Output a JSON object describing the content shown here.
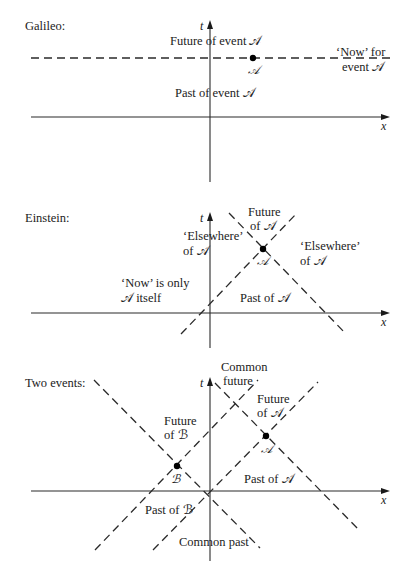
{
  "panels": [
    {
      "title": "Galileo:",
      "title_pos": [
        25,
        30
      ],
      "axes": {
        "x_axis": {
          "x1": 31,
          "x2": 390,
          "y": 117,
          "label": "x",
          "label_pos": [
            381,
            130
          ]
        },
        "t_axis": {
          "x": 210,
          "y1": 182,
          "y2": 20,
          "label": "t",
          "label_pos": [
            200,
            30
          ]
        }
      },
      "dashed_lines": [
        {
          "x1": 31,
          "y1": 58,
          "x2": 390,
          "y2": 58
        }
      ],
      "points": [
        {
          "name": "A",
          "cx": 253,
          "cy": 58,
          "label": "𝒜",
          "label_pos": [
            248,
            74
          ]
        }
      ],
      "labels": [
        {
          "text": "Future of event 𝒜",
          "x": 170,
          "y": 45
        },
        {
          "text": "‘Now’ for",
          "x": 336,
          "y": 56
        },
        {
          "text": "event 𝒜",
          "x": 342,
          "y": 71
        },
        {
          "text": "Past of event 𝒜",
          "x": 175,
          "y": 97
        }
      ]
    },
    {
      "title": "Einstein:",
      "title_pos": [
        25,
        222
      ],
      "axes": {
        "x_axis": {
          "x1": 31,
          "x2": 390,
          "y": 313,
          "label": "x",
          "label_pos": [
            381,
            326
          ]
        },
        "t_axis": {
          "x": 210,
          "y1": 348,
          "y2": 212,
          "label": "t",
          "label_pos": [
            200,
            222
          ]
        }
      },
      "dashed_lines": [
        {
          "x1": 181,
          "y1": 334,
          "x2": 297,
          "y2": 213
        },
        {
          "x1": 229,
          "y1": 213,
          "x2": 346,
          "y2": 334
        }
      ],
      "points": [
        {
          "name": "A",
          "cx": 263,
          "cy": 249,
          "label": "𝒜",
          "label_pos": [
            257,
            265
          ]
        }
      ],
      "labels": [
        {
          "text": "Future",
          "x": 248,
          "y": 216
        },
        {
          "text": "of 𝒜",
          "x": 250,
          "y": 230
        },
        {
          "text": "‘Elsewhere’",
          "x": 183,
          "y": 240
        },
        {
          "text": "of  𝒜",
          "x": 183,
          "y": 255
        },
        {
          "text": "‘Elsewhere’",
          "x": 300,
          "y": 250
        },
        {
          "text": "of 𝒜",
          "x": 300,
          "y": 265
        },
        {
          "text": "‘Now’ is only",
          "x": 121,
          "y": 287
        },
        {
          "text": "𝒜 itself",
          "x": 121,
          "y": 302
        },
        {
          "text": "Past of 𝒜",
          "x": 240,
          "y": 302
        }
      ]
    },
    {
      "title": "Two events:",
      "title_pos": [
        25,
        387
      ],
      "axes": {
        "x_axis": {
          "x1": 31,
          "x2": 390,
          "y": 491,
          "label": "x",
          "label_pos": [
            381,
            504
          ]
        },
        "t_axis": {
          "x": 210,
          "y1": 561,
          "y2": 377,
          "label": "t",
          "label_pos": [
            200,
            387
          ]
        }
      },
      "dashed_lines": [
        {
          "x1": 94,
          "y1": 380,
          "x2": 260,
          "y2": 548
        },
        {
          "x1": 95,
          "y1": 550,
          "x2": 258,
          "y2": 380
        },
        {
          "x1": 215,
          "y1": 383,
          "x2": 360,
          "y2": 531
        },
        {
          "x1": 153,
          "y1": 550,
          "x2": 318,
          "y2": 382
        }
      ],
      "points": [
        {
          "name": "A",
          "cx": 266,
          "cy": 436,
          "label": "𝒜",
          "label_pos": [
            261,
            453
          ]
        },
        {
          "name": "B",
          "cx": 177,
          "cy": 466,
          "label": "ℬ",
          "label_pos": [
            171,
            483
          ]
        }
      ],
      "labels": [
        {
          "text": "Common",
          "x": 221,
          "y": 371
        },
        {
          "text": "future",
          "x": 223,
          "y": 385
        },
        {
          "text": "Future",
          "x": 257,
          "y": 403
        },
        {
          "text": "of 𝒜",
          "x": 257,
          "y": 417
        },
        {
          "text": "Future",
          "x": 164,
          "y": 425
        },
        {
          "text": "of  ℬ",
          "x": 164,
          "y": 439
        },
        {
          "text": "Past of 𝒜",
          "x": 244,
          "y": 483
        },
        {
          "text": "Past of  ℬ",
          "x": 145,
          "y": 514
        },
        {
          "text": "Common past",
          "x": 179,
          "y": 546
        }
      ]
    }
  ]
}
